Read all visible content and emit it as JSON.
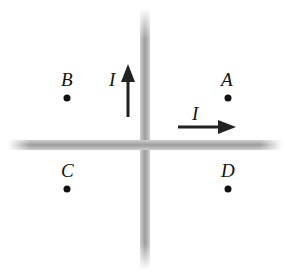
{
  "diagram": {
    "wires": {
      "vertical": {
        "x": 145,
        "y_top": 10,
        "y_bottom": 268,
        "color": "#a8a8a8"
      },
      "horizontal": {
        "y": 145,
        "x_left": 10,
        "x_right": 280,
        "color": "#a8a8a8"
      }
    },
    "currents": [
      {
        "label": "I",
        "direction": "up",
        "wire": "vertical"
      },
      {
        "label": "I",
        "direction": "right",
        "wire": "horizontal"
      }
    ],
    "points": [
      {
        "label": "A",
        "x": 228,
        "y": 98
      },
      {
        "label": "B",
        "x": 67,
        "y": 98
      },
      {
        "label": "C",
        "x": 67,
        "y": 189
      },
      {
        "label": "D",
        "x": 228,
        "y": 189
      }
    ]
  }
}
